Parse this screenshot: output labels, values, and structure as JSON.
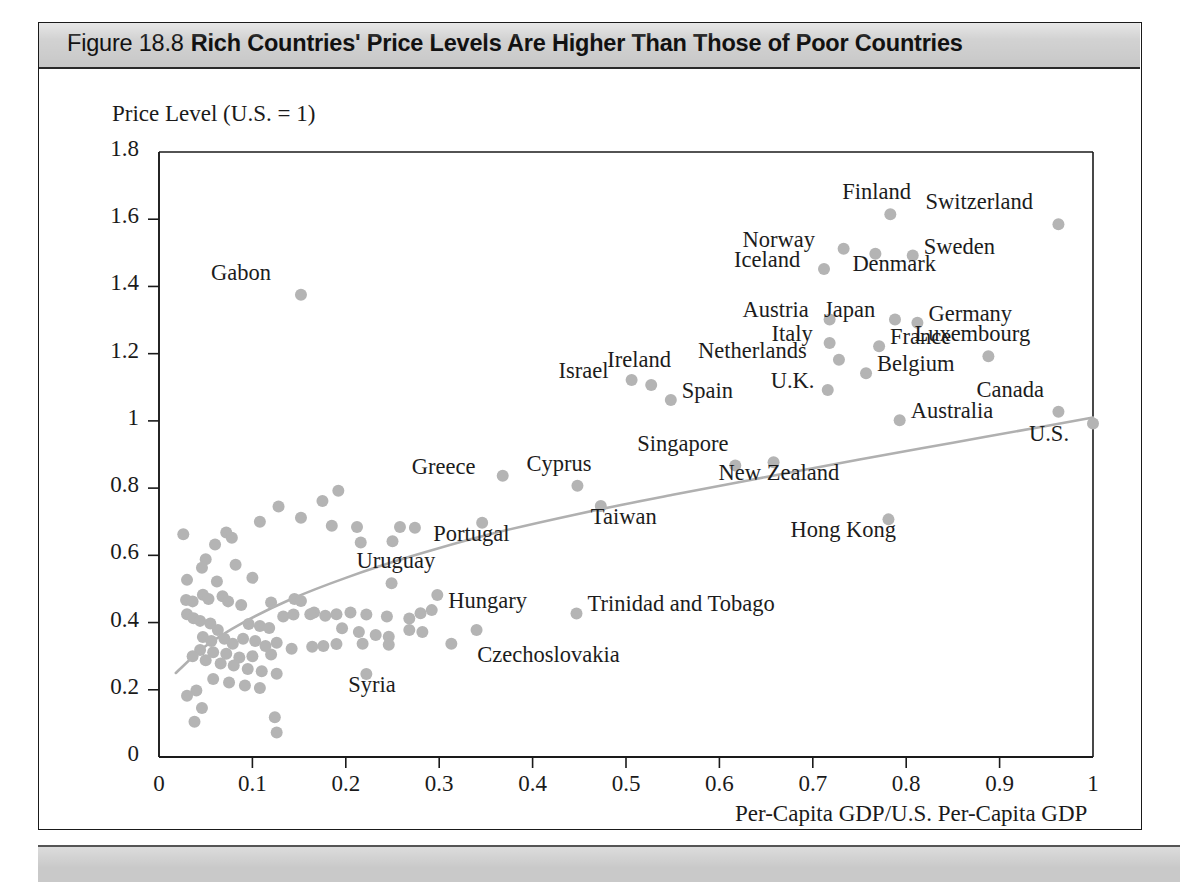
{
  "figure": {
    "number_label": "Figure 18.8",
    "caption": "Rich Countries' Price Levels Are Higher Than Those of Poor Countries",
    "header_bg": "#d2d2d2",
    "footer_bg": "#c9c9c9"
  },
  "chart_data": {
    "type": "scatter",
    "title": "Rich Countries' Price Levels Are Higher Than Those of Poor Countries",
    "xlabel": "Per-Capita GDP/U.S. Per-Capita GDP",
    "ylabel": "Price Level (U.S. = 1)",
    "xlim": [
      0,
      1
    ],
    "ylim": [
      0,
      1.8
    ],
    "grid": false,
    "legend": null,
    "xticks": [
      "0",
      "0.1",
      "0.2",
      "0.3",
      "0.4",
      "0.5",
      "0.6",
      "0.7",
      "0.8",
      "0.9",
      "1"
    ],
    "xtick_values": [
      0,
      0.1,
      0.2,
      0.3,
      0.4,
      0.5,
      0.6,
      0.7,
      0.8,
      0.9,
      1
    ],
    "yticks": [
      "0",
      "0.2",
      "0.4",
      "0.6",
      "0.8",
      "1",
      "1.2",
      "1.4",
      "1.6",
      "1.8"
    ],
    "ytick_values": [
      0,
      0.2,
      0.4,
      0.6,
      0.8,
      1,
      1.2,
      1.4,
      1.6,
      1.8
    ],
    "marker_color": "#b4b4b4",
    "trendline_color": "#b0b0b0",
    "axis_color": "#1a1a1a",
    "labeled_points": [
      {
        "name": "Gabon",
        "x": 0.152,
        "y": 1.375,
        "lx": -90,
        "ly": -26
      },
      {
        "name": "Finland",
        "x": 0.783,
        "y": 1.615,
        "lx": -48,
        "ly": -26
      },
      {
        "name": "Switzerland",
        "x": 0.963,
        "y": 1.585,
        "lx": -133,
        "ly": -26
      },
      {
        "name": "Norway",
        "x": 0.733,
        "y": 1.512,
        "lx": -101,
        "ly": -13
      },
      {
        "name": "Sweden",
        "x": 0.807,
        "y": 1.492,
        "lx": 11,
        "ly": -13
      },
      {
        "name": "Iceland",
        "x": 0.712,
        "y": 1.452,
        "lx": -90,
        "ly": -13
      },
      {
        "name": "Denmark",
        "x": 0.767,
        "y": 1.497,
        "lx": -23,
        "ly": 6
      },
      {
        "name": "Austria",
        "x": 0.718,
        "y": 1.302,
        "lx": -87,
        "ly": -13
      },
      {
        "name": "Japan",
        "x": 0.788,
        "y": 1.302,
        "lx": -71,
        "ly": -13
      },
      {
        "name": "Germany",
        "x": 0.812,
        "y": 1.292,
        "lx": 11,
        "ly": -13
      },
      {
        "name": "Italy",
        "x": 0.718,
        "y": 1.232,
        "lx": -58,
        "ly": -13
      },
      {
        "name": "France",
        "x": 0.771,
        "y": 1.222,
        "lx": 11,
        "ly": -13
      },
      {
        "name": "Luxembourg",
        "x": 0.888,
        "y": 1.192,
        "lx": -74,
        "ly": -26
      },
      {
        "name": "Netherlands",
        "x": 0.728,
        "y": 1.182,
        "lx": -141,
        "ly": -13
      },
      {
        "name": "Belgium",
        "x": 0.757,
        "y": 1.142,
        "lx": 11,
        "ly": -13
      },
      {
        "name": "U.K.",
        "x": 0.716,
        "y": 1.092,
        "lx": -57,
        "ly": -13
      },
      {
        "name": "Israel",
        "x": 0.506,
        "y": 1.122,
        "lx": -73,
        "ly": -13
      },
      {
        "name": "Ireland",
        "x": 0.527,
        "y": 1.107,
        "lx": -44,
        "ly": -29
      },
      {
        "name": "Spain",
        "x": 0.548,
        "y": 1.062,
        "lx": 11,
        "ly": -13
      },
      {
        "name": "Canada",
        "x": 0.963,
        "y": 1.027,
        "lx": -82,
        "ly": -26
      },
      {
        "name": "U.S.",
        "x": 1.0,
        "y": 0.992,
        "lx": -64,
        "ly": 6
      },
      {
        "name": "Australia",
        "x": 0.793,
        "y": 1.002,
        "lx": 11,
        "ly": -13
      },
      {
        "name": "Singapore",
        "x": 0.617,
        "y": 0.867,
        "lx": -98,
        "ly": -26
      },
      {
        "name": "New Zealand",
        "x": 0.658,
        "y": 0.877,
        "lx": -55,
        "ly": 7
      },
      {
        "name": "Greece",
        "x": 0.368,
        "y": 0.837,
        "lx": -91,
        "ly": -13
      },
      {
        "name": "Cyprus",
        "x": 0.448,
        "y": 0.807,
        "lx": -51,
        "ly": -26
      },
      {
        "name": "Taiwan",
        "x": 0.473,
        "y": 0.747,
        "lx": -10,
        "ly": 7
      },
      {
        "name": "Portugal",
        "x": 0.346,
        "y": 0.697,
        "lx": -49,
        "ly": 7
      },
      {
        "name": "Hong Kong",
        "x": 0.781,
        "y": 0.707,
        "lx": -98,
        "ly": 7
      },
      {
        "name": "Uruguay",
        "x": 0.249,
        "y": 0.517,
        "lx": -35,
        "ly": -26
      },
      {
        "name": "Hungary",
        "x": 0.298,
        "y": 0.482,
        "lx": 11,
        "ly": 2
      },
      {
        "name": "Trinidad and Tobago",
        "x": 0.447,
        "y": 0.427,
        "lx": 11,
        "ly": -13
      },
      {
        "name": "Czechoslovakia",
        "x": 0.313,
        "y": 0.337,
        "lx": 26,
        "ly": 7
      },
      {
        "name": "Syria",
        "x": 0.222,
        "y": 0.247,
        "lx": -18,
        "ly": 7
      }
    ],
    "unlabeled_points": [
      {
        "x": 0.026,
        "y": 0.663
      },
      {
        "x": 0.06,
        "y": 0.632
      },
      {
        "x": 0.072,
        "y": 0.668
      },
      {
        "x": 0.078,
        "y": 0.652
      },
      {
        "x": 0.05,
        "y": 0.588
      },
      {
        "x": 0.046,
        "y": 0.563
      },
      {
        "x": 0.082,
        "y": 0.572
      },
      {
        "x": 0.108,
        "y": 0.7
      },
      {
        "x": 0.128,
        "y": 0.745
      },
      {
        "x": 0.152,
        "y": 0.712
      },
      {
        "x": 0.175,
        "y": 0.762
      },
      {
        "x": 0.192,
        "y": 0.792
      },
      {
        "x": 0.185,
        "y": 0.688
      },
      {
        "x": 0.212,
        "y": 0.684
      },
      {
        "x": 0.258,
        "y": 0.684
      },
      {
        "x": 0.274,
        "y": 0.682
      },
      {
        "x": 0.216,
        "y": 0.638
      },
      {
        "x": 0.25,
        "y": 0.642
      },
      {
        "x": 0.03,
        "y": 0.527
      },
      {
        "x": 0.062,
        "y": 0.522
      },
      {
        "x": 0.1,
        "y": 0.533
      },
      {
        "x": 0.029,
        "y": 0.467
      },
      {
        "x": 0.036,
        "y": 0.463
      },
      {
        "x": 0.047,
        "y": 0.483
      },
      {
        "x": 0.053,
        "y": 0.47
      },
      {
        "x": 0.068,
        "y": 0.478
      },
      {
        "x": 0.074,
        "y": 0.463
      },
      {
        "x": 0.088,
        "y": 0.452
      },
      {
        "x": 0.12,
        "y": 0.46
      },
      {
        "x": 0.145,
        "y": 0.47
      },
      {
        "x": 0.152,
        "y": 0.464
      },
      {
        "x": 0.03,
        "y": 0.425
      },
      {
        "x": 0.037,
        "y": 0.413
      },
      {
        "x": 0.044,
        "y": 0.405
      },
      {
        "x": 0.055,
        "y": 0.397
      },
      {
        "x": 0.063,
        "y": 0.378
      },
      {
        "x": 0.047,
        "y": 0.357
      },
      {
        "x": 0.056,
        "y": 0.345
      },
      {
        "x": 0.07,
        "y": 0.352
      },
      {
        "x": 0.079,
        "y": 0.337
      },
      {
        "x": 0.096,
        "y": 0.396
      },
      {
        "x": 0.108,
        "y": 0.39
      },
      {
        "x": 0.118,
        "y": 0.384
      },
      {
        "x": 0.09,
        "y": 0.352
      },
      {
        "x": 0.103,
        "y": 0.345
      },
      {
        "x": 0.114,
        "y": 0.33
      },
      {
        "x": 0.126,
        "y": 0.34
      },
      {
        "x": 0.133,
        "y": 0.418
      },
      {
        "x": 0.144,
        "y": 0.424
      },
      {
        "x": 0.166,
        "y": 0.43
      },
      {
        "x": 0.178,
        "y": 0.42
      },
      {
        "x": 0.19,
        "y": 0.425
      },
      {
        "x": 0.205,
        "y": 0.43
      },
      {
        "x": 0.222,
        "y": 0.424
      },
      {
        "x": 0.244,
        "y": 0.418
      },
      {
        "x": 0.268,
        "y": 0.412
      },
      {
        "x": 0.28,
        "y": 0.428
      },
      {
        "x": 0.292,
        "y": 0.437
      },
      {
        "x": 0.268,
        "y": 0.378
      },
      {
        "x": 0.282,
        "y": 0.372
      },
      {
        "x": 0.196,
        "y": 0.383
      },
      {
        "x": 0.214,
        "y": 0.372
      },
      {
        "x": 0.232,
        "y": 0.363
      },
      {
        "x": 0.246,
        "y": 0.358
      },
      {
        "x": 0.34,
        "y": 0.378
      },
      {
        "x": 0.246,
        "y": 0.334
      },
      {
        "x": 0.218,
        "y": 0.337
      },
      {
        "x": 0.19,
        "y": 0.336
      },
      {
        "x": 0.164,
        "y": 0.328
      },
      {
        "x": 0.142,
        "y": 0.322
      },
      {
        "x": 0.12,
        "y": 0.305
      },
      {
        "x": 0.1,
        "y": 0.3
      },
      {
        "x": 0.086,
        "y": 0.296
      },
      {
        "x": 0.072,
        "y": 0.307
      },
      {
        "x": 0.058,
        "y": 0.312
      },
      {
        "x": 0.044,
        "y": 0.318
      },
      {
        "x": 0.036,
        "y": 0.3
      },
      {
        "x": 0.05,
        "y": 0.288
      },
      {
        "x": 0.066,
        "y": 0.278
      },
      {
        "x": 0.08,
        "y": 0.272
      },
      {
        "x": 0.095,
        "y": 0.262
      },
      {
        "x": 0.11,
        "y": 0.255
      },
      {
        "x": 0.126,
        "y": 0.248
      },
      {
        "x": 0.058,
        "y": 0.232
      },
      {
        "x": 0.075,
        "y": 0.222
      },
      {
        "x": 0.092,
        "y": 0.213
      },
      {
        "x": 0.108,
        "y": 0.205
      },
      {
        "x": 0.04,
        "y": 0.198
      },
      {
        "x": 0.03,
        "y": 0.182
      },
      {
        "x": 0.046,
        "y": 0.146
      },
      {
        "x": 0.038,
        "y": 0.105
      },
      {
        "x": 0.124,
        "y": 0.118
      },
      {
        "x": 0.126,
        "y": 0.073
      },
      {
        "x": 0.162,
        "y": 0.425
      },
      {
        "x": 0.176,
        "y": 0.33
      }
    ],
    "trendline": {
      "description": "Upward-sloping concave curve fitted through the scatter",
      "points": [
        {
          "x": 0.018,
          "y": 0.25
        },
        {
          "x": 0.05,
          "y": 0.33
        },
        {
          "x": 0.09,
          "y": 0.4
        },
        {
          "x": 0.14,
          "y": 0.468
        },
        {
          "x": 0.2,
          "y": 0.533
        },
        {
          "x": 0.27,
          "y": 0.597
        },
        {
          "x": 0.35,
          "y": 0.66
        },
        {
          "x": 0.45,
          "y": 0.724
        },
        {
          "x": 0.55,
          "y": 0.78
        },
        {
          "x": 0.65,
          "y": 0.833
        },
        {
          "x": 0.75,
          "y": 0.885
        },
        {
          "x": 0.85,
          "y": 0.935
        },
        {
          "x": 0.95,
          "y": 0.985
        },
        {
          "x": 1.0,
          "y": 1.01
        }
      ]
    }
  }
}
